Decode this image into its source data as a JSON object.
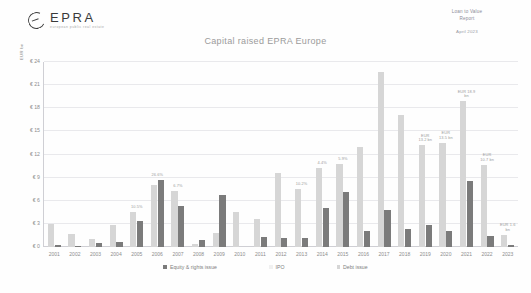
{
  "brand": {
    "wordmark": "EPRA",
    "subword": "european public real estate",
    "logo_icon": "epra-circle-logo"
  },
  "document": {
    "title": "Loan to Value\nReport",
    "title_line1": "Loan to Value",
    "title_line2": "Report",
    "date": "April 2023"
  },
  "legend": {
    "items": [
      {
        "label": "Equity & rights issue",
        "color": "#7b7b7b",
        "key": "equity"
      },
      {
        "label": "IPO",
        "color": "#f0f0f0",
        "key": "ipo"
      },
      {
        "label": "Debt issue",
        "color": "#d6d6d6",
        "key": "debt"
      }
    ]
  },
  "colors": {
    "equity": "#7b7b7b",
    "ipo": "#f0f0f0",
    "debt": "#d6d6d6",
    "grid": "#e9e9ec",
    "axis": "#cfcfd4",
    "text": "#8d8d8d"
  },
  "chart_data": {
    "type": "bar",
    "title": "Capital raised EPRA Europe",
    "xlabel": "",
    "ylabel": "EUR bn",
    "ylim": [
      0,
      24
    ],
    "yticks": [
      "€ 0",
      "€ 3",
      "€ 6",
      "€ 9",
      "€ 12",
      "€ 15",
      "€ 18",
      "€ 21",
      "€ 24"
    ],
    "ytick_values": [
      0,
      3,
      6,
      9,
      12,
      15,
      18,
      21,
      24
    ],
    "grid": true,
    "legend_position": "bottom",
    "categories": [
      "2001",
      "2002",
      "2003",
      "2004",
      "2005",
      "2006",
      "2007",
      "2008",
      "2009",
      "2010",
      "2011",
      "2012",
      "2013",
      "2014",
      "2015",
      "2016",
      "2017",
      "2018",
      "2019",
      "2020",
      "2021",
      "2022",
      "2023"
    ],
    "series": [
      {
        "name": "Debt issue",
        "color": "#d6d6d6",
        "values": [
          3.0,
          1.7,
          1.0,
          2.9,
          4.5,
          8.1,
          7.3,
          0.4,
          1.8,
          4.5,
          3.6,
          9.6,
          7.5,
          10.3,
          10.8,
          13.0,
          22.7,
          17.1,
          13.2,
          13.5,
          18.9,
          10.7,
          1.6
        ]
      },
      {
        "name": "Equity & rights issue",
        "color": "#7b7b7b",
        "values": [
          0.2,
          0.1,
          0.5,
          0.6,
          3.4,
          8.7,
          5.3,
          0.9,
          6.7,
          0.0,
          0.0,
          0.0,
          1.2,
          5.0,
          7.2,
          0.0,
          0.0,
          0.0,
          0.0,
          0.0,
          0.0,
          0.0,
          0.0
        ]
      },
      {
        "name": "IPO",
        "color": "#f0f0f0",
        "values": [
          0.0,
          0.0,
          0.0,
          0.0,
          0.0,
          0.0,
          0.0,
          0.0,
          0.0,
          0.0,
          0.0,
          0.0,
          0.0,
          0.0,
          0.0,
          0.0,
          0.0,
          0.0,
          0.0,
          0.0,
          0.0,
          0.0,
          0.0
        ]
      }
    ],
    "bars": [
      {
        "year": "2001",
        "debt": 3.0,
        "equity": 0.2,
        "note": ""
      },
      {
        "year": "2002",
        "debt": 1.7,
        "equity": 0.1,
        "note": ""
      },
      {
        "year": "2003",
        "debt": 1.0,
        "equity": 0.5,
        "note": ""
      },
      {
        "year": "2004",
        "debt": 2.9,
        "equity": 0.6,
        "note": ""
      },
      {
        "year": "2005",
        "debt": 4.5,
        "equity": 3.4,
        "note": "10.5%"
      },
      {
        "year": "2006",
        "debt": 8.1,
        "equity": 8.7,
        "note": "26.6%"
      },
      {
        "year": "2007",
        "debt": 7.3,
        "equity": 5.3,
        "note": "6.7%"
      },
      {
        "year": "2008",
        "debt": 0.4,
        "equity": 0.9,
        "note": ""
      },
      {
        "year": "2009",
        "debt": 1.8,
        "equity": 6.7,
        "note": ""
      },
      {
        "year": "2010",
        "debt": 4.5,
        "equity": 0.0,
        "note": ""
      },
      {
        "year": "2011",
        "debt": 3.6,
        "equity": 1.3,
        "note": ""
      },
      {
        "year": "2012",
        "debt": 9.6,
        "equity": 1.2,
        "note": ""
      },
      {
        "year": "2013",
        "debt": 7.5,
        "equity": 1.2,
        "note": "10.2%"
      },
      {
        "year": "2014",
        "debt": 10.3,
        "equity": 5.0,
        "note": "4.4%"
      },
      {
        "year": "2015",
        "debt": 10.8,
        "equity": 7.2,
        "note": "5.9%"
      },
      {
        "year": "2016",
        "debt": 13.0,
        "equity": 2.1,
        "note": ""
      },
      {
        "year": "2017",
        "debt": 22.7,
        "equity": 4.8,
        "note": ""
      },
      {
        "year": "2018",
        "debt": 17.1,
        "equity": 2.3,
        "note": ""
      },
      {
        "year": "2019",
        "debt": 13.2,
        "equity": 2.8,
        "note": "EUR\n13.2 bn"
      },
      {
        "year": "2020",
        "debt": 13.5,
        "equity": 2.1,
        "note": "EUR\n13.5 bn"
      },
      {
        "year": "2021",
        "debt": 18.9,
        "equity": 8.5,
        "note": "EUR 18.9\nbn"
      },
      {
        "year": "2022",
        "debt": 10.7,
        "equity": 1.4,
        "note": "EUR\n10.7 bn"
      },
      {
        "year": "2023",
        "debt": 1.6,
        "equity": 0.3,
        "note": "EUR 1.6\nbn"
      }
    ]
  }
}
